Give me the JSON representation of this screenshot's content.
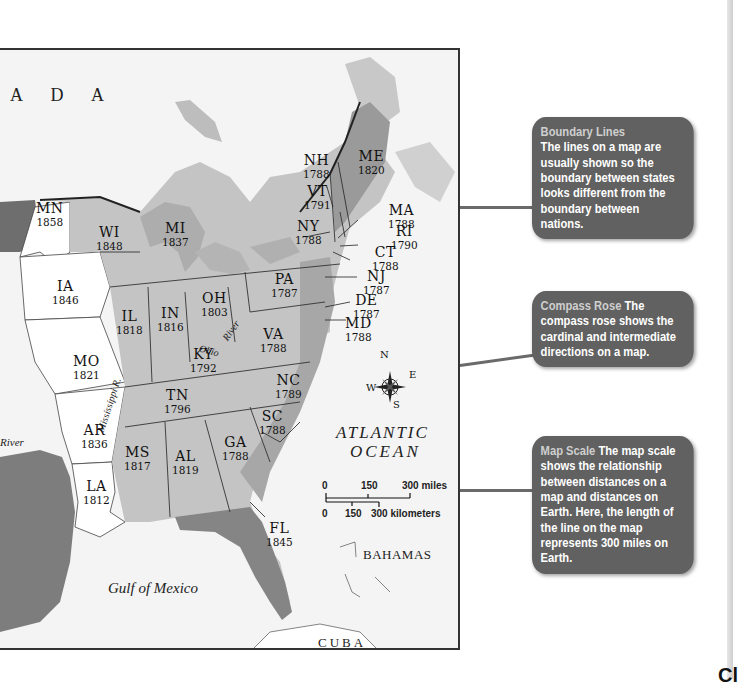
{
  "map": {
    "region_labels": {
      "canada": "A D A",
      "atlantic_line1": "ATLANTIC",
      "atlantic_line2": "OCEAN",
      "gulf": "Gulf of Mexico",
      "bahamas": "BAHAMAS",
      "cuba": "CUBA",
      "river_west": "River",
      "ohio_river_a": "Ohio",
      "ohio_river_b": "River",
      "mississippi": "Mississippi R."
    },
    "states": [
      {
        "abbr": "NH",
        "year": "1788"
      },
      {
        "abbr": "VT",
        "year": "1791"
      },
      {
        "abbr": "ME",
        "year": "1820"
      },
      {
        "abbr": "MA",
        "year": "1788"
      },
      {
        "abbr": "RI",
        "year": "1790"
      },
      {
        "abbr": "CT",
        "year": "1788"
      },
      {
        "abbr": "NY",
        "year": "1788"
      },
      {
        "abbr": "NJ",
        "year": "1787"
      },
      {
        "abbr": "PA",
        "year": "1787"
      },
      {
        "abbr": "DE",
        "year": "1787"
      },
      {
        "abbr": "MD",
        "year": "1788"
      },
      {
        "abbr": "VA",
        "year": "1788"
      },
      {
        "abbr": "NC",
        "year": "1789"
      },
      {
        "abbr": "SC",
        "year": "1788"
      },
      {
        "abbr": "GA",
        "year": "1788"
      },
      {
        "abbr": "FL",
        "year": "1845"
      },
      {
        "abbr": "AL",
        "year": "1819"
      },
      {
        "abbr": "MS",
        "year": "1817"
      },
      {
        "abbr": "TN",
        "year": "1796"
      },
      {
        "abbr": "KY",
        "year": "1792"
      },
      {
        "abbr": "OH",
        "year": "1803"
      },
      {
        "abbr": "IN",
        "year": "1816"
      },
      {
        "abbr": "IL",
        "year": "1818"
      },
      {
        "abbr": "MI",
        "year": "1837"
      },
      {
        "abbr": "WI",
        "year": "1848"
      },
      {
        "abbr": "MN",
        "year": "1858"
      },
      {
        "abbr": "IA",
        "year": "1846"
      },
      {
        "abbr": "MO",
        "year": "1821"
      },
      {
        "abbr": "AR",
        "year": "1836"
      },
      {
        "abbr": "LA",
        "year": "1812"
      }
    ],
    "compass": {
      "n": "N",
      "s": "S",
      "e": "E",
      "w": "W"
    },
    "scale": {
      "miles": {
        "ticks": [
          "0",
          "150",
          "300 miles"
        ]
      },
      "kilometers": {
        "ticks": [
          "0",
          "150",
          "300 kilometers"
        ]
      }
    }
  },
  "callouts": [
    {
      "title": "Boundary Lines",
      "body": "The lines on a map are usually shown so the boundary between states looks different from the boundary between nations."
    },
    {
      "title": "Compass Rose",
      "body": "The compass rose shows the cardinal and intermediate directions on a map."
    },
    {
      "title": "Map Scale",
      "body": "The map scale shows the relationship between distances on a map and distances on Earth. Here, the length of the line on the map represents 300 miles on Earth."
    }
  ],
  "corner_text": "Cl",
  "colors": {
    "callout_bg": "#616161",
    "callout_title": "#cfcfcf",
    "state_fill": "#c4c4c4",
    "territory_fill": "#ffffff",
    "dark_fill": "#7a7a7a",
    "water": "#f4f4f4"
  }
}
